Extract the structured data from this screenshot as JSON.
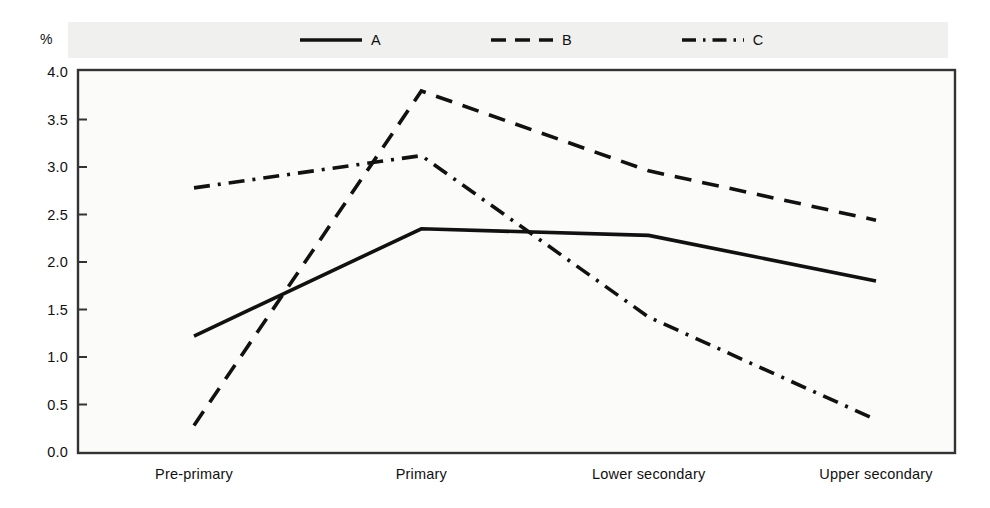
{
  "axis_label": "%",
  "legend": {
    "position": "top",
    "items": [
      {
        "label": "A",
        "style": "solid",
        "icon": "solid-line-icon"
      },
      {
        "label": "B",
        "style": "dashed",
        "icon": "dashed-line-icon"
      },
      {
        "label": "C",
        "style": "dashdot",
        "icon": "dash-dot-line-icon"
      }
    ]
  },
  "colors": {
    "line": "#111111",
    "frame": "#333333",
    "plot_background": "#fbfbfa",
    "legend_band": "#f0f0ee",
    "page_background": "#ffffff"
  },
  "chart_data": {
    "type": "line",
    "title": "",
    "subtitle": "",
    "xlabel": "",
    "ylabel": "%",
    "categories": [
      "Pre-primary",
      "Primary",
      "Lower secondary",
      "Upper secondary"
    ],
    "ylim": [
      0.0,
      4.0
    ],
    "yticks": [
      "0.0",
      "0.5",
      "1.0",
      "1.5",
      "2.0",
      "2.5",
      "3.0",
      "3.5",
      "4.0"
    ],
    "ytick_values": [
      0.0,
      0.5,
      1.0,
      1.5,
      2.0,
      2.5,
      3.0,
      3.5,
      4.0
    ],
    "grid": false,
    "legend_position": "top",
    "series": [
      {
        "name": "A",
        "style": "solid",
        "values": [
          1.22,
          2.35,
          2.28,
          1.8
        ]
      },
      {
        "name": "B",
        "style": "dashed",
        "values": [
          0.28,
          3.8,
          2.96,
          2.44
        ]
      },
      {
        "name": "C",
        "style": "dashdot",
        "values": [
          2.78,
          3.12,
          1.42,
          0.34
        ]
      }
    ]
  }
}
